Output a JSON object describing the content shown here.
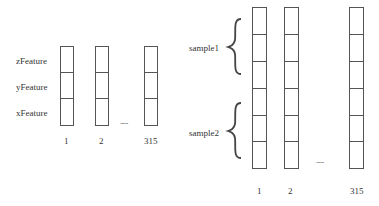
{
  "left_diagram": {
    "row_labels": [
      "zFeature",
      "yFeature",
      "xFeature"
    ],
    "column_labels": [
      "1",
      "2",
      "315"
    ],
    "ellipsis": "......",
    "cells_per_column": 3
  },
  "right_diagram": {
    "group_labels": [
      "sample1",
      "sample2"
    ],
    "column_labels": [
      "1",
      "2",
      "315"
    ],
    "ellipsis": "......",
    "cells_per_column": 6
  }
}
